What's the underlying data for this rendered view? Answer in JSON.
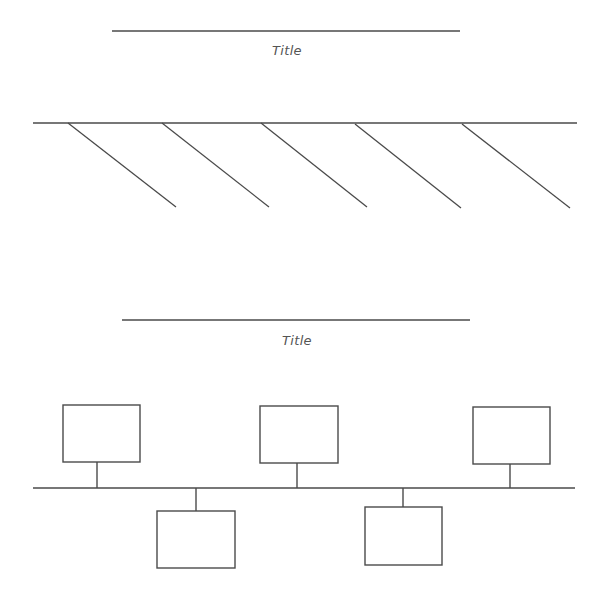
{
  "colors": {
    "line": "#4a4a4a",
    "background": "#ffffff",
    "title_text": "#555555"
  },
  "fishbone": {
    "title": "Title",
    "title_line": {
      "x1": 112,
      "x2": 460,
      "y": 31
    },
    "spine": {
      "x1": 33,
      "x2": 577,
      "y": 123
    },
    "branches": [
      {
        "x1": 68,
        "y1": 123,
        "x2": 176,
        "y2": 207
      },
      {
        "x1": 162,
        "y1": 123,
        "x2": 269,
        "y2": 207
      },
      {
        "x1": 261,
        "y1": 123,
        "x2": 367,
        "y2": 207
      },
      {
        "x1": 355,
        "y1": 124,
        "x2": 461,
        "y2": 208
      },
      {
        "x1": 462,
        "y1": 124,
        "x2": 570,
        "y2": 208
      }
    ]
  },
  "timeline": {
    "title": "Title",
    "title_line": {
      "x1": 122,
      "x2": 470,
      "y": 320
    },
    "axis": {
      "x1": 33,
      "x2": 575,
      "y": 488
    },
    "boxes_above": [
      {
        "x": 63,
        "y": 405,
        "w": 77,
        "h": 57,
        "connector_x": 97
      },
      {
        "x": 260,
        "y": 406,
        "w": 78,
        "h": 57,
        "connector_x": 297
      },
      {
        "x": 473,
        "y": 407,
        "w": 77,
        "h": 57,
        "connector_x": 510
      }
    ],
    "boxes_below": [
      {
        "x": 157,
        "y": 511,
        "w": 78,
        "h": 57,
        "connector_x": 196
      },
      {
        "x": 365,
        "y": 507,
        "w": 77,
        "h": 58,
        "connector_x": 403
      }
    ]
  }
}
